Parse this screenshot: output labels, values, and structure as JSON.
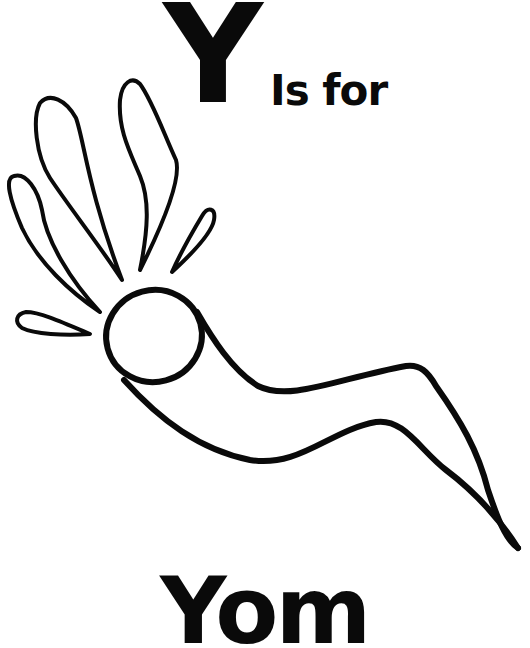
{
  "page": {
    "letter": "Y",
    "caption": "Is for",
    "word": "Yom",
    "illustration": "shofar-icon",
    "ink_color": "#0a0a0a",
    "background_color": "#ffffff"
  }
}
